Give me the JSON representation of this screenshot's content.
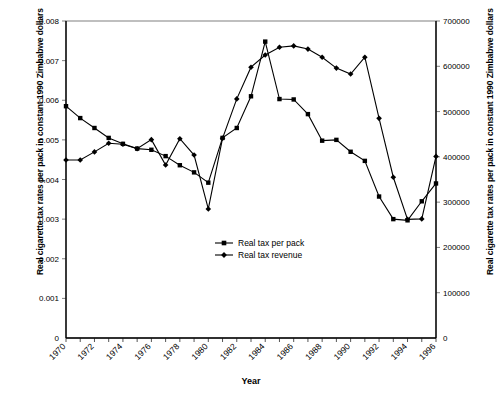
{
  "chart_data": {
    "type": "line",
    "title": "",
    "xlabel": "Year",
    "ylabel": "Real cigarette tax rates per pack in constant 1990 Zimbabwe dollars",
    "ylabel_right": "Real cigarette tax rates per pack in constant 1990 Zimbabwe dollars",
    "x": [
      1970,
      1971,
      1972,
      1973,
      1974,
      1975,
      1976,
      1977,
      1978,
      1979,
      1980,
      1981,
      1982,
      1983,
      1984,
      1985,
      1986,
      1987,
      1988,
      1989,
      1990,
      1991,
      1992,
      1993,
      1994,
      1995,
      1996
    ],
    "xlim": [
      1970,
      1996
    ],
    "ylim_left": [
      0,
      0.008
    ],
    "ylim_right": [
      0,
      700000
    ],
    "grid": false,
    "legend_position": "center",
    "yticks_left": [
      "0",
      "0.001",
      "0.002",
      "0.003",
      "0.004",
      "0.005",
      "0.006",
      "0.007",
      "0.008"
    ],
    "yticks_right": [
      "0",
      "100000",
      "200000",
      "300000",
      "400000",
      "500000",
      "600000",
      "700000"
    ],
    "xticks": [
      "1970",
      "1972",
      "1974",
      "1976",
      "1978",
      "1980",
      "1982",
      "1984",
      "1986",
      "1988",
      "1990",
      "1992",
      "1994",
      "1996"
    ],
    "series": [
      {
        "name": "Real tax per pack",
        "marker": "square",
        "axis": "left",
        "values": [
          0.00585,
          0.00555,
          0.0053,
          0.00505,
          0.0049,
          0.00478,
          0.00475,
          0.00459,
          0.00436,
          0.00418,
          0.00392,
          0.00505,
          0.0053,
          0.0061,
          0.00748,
          0.00603,
          0.00602,
          0.00565,
          0.00498,
          0.005,
          0.0047,
          0.00447,
          0.00357,
          0.003,
          0.00297,
          0.00345,
          0.0039
        ]
      },
      {
        "name": "Real tax revenue",
        "marker": "diamond",
        "axis": "right",
        "values": [
          393000,
          393000,
          411000,
          430000,
          428000,
          418000,
          438000,
          382000,
          440000,
          404000,
          285000,
          441000,
          528000,
          598000,
          625000,
          642000,
          645000,
          638000,
          620000,
          596000,
          583000,
          620000,
          485000,
          355000,
          262000,
          263000,
          401000
        ]
      }
    ],
    "legend": [
      {
        "label": "Real tax per pack",
        "marker": "square"
      },
      {
        "label": "Real tax revenue",
        "marker": "diamond"
      }
    ]
  },
  "axes": {
    "x_title": "Year",
    "y_left_title": "Real cigarette tax rates per pack in constant 1990 Zimbabwe dollars",
    "y_right_title": "Real cigarette tax rates per pack in constant 1990 Zimbabwe dollars"
  }
}
